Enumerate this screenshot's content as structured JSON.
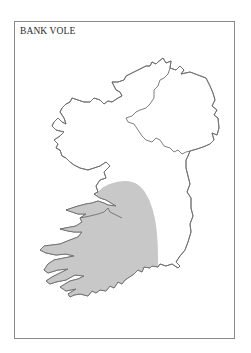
{
  "map": {
    "title": "BANK VOLE",
    "region": "Ireland",
    "legend": {
      "range_fill_color": "#c8c8c8",
      "outline_color": "#6f6f6f",
      "frame_color": "#8a8a8a"
    },
    "features": [
      {
        "name": "island-of-ireland-outline",
        "type": "coastline"
      },
      {
        "name": "northern-ireland-border",
        "type": "border"
      },
      {
        "name": "bank-vole-distribution",
        "type": "shaded-range",
        "area": "south-west Ireland"
      }
    ]
  }
}
